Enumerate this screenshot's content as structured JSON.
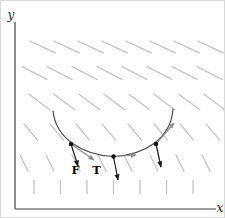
{
  "figure": {
    "background": "#ffffff",
    "labels": {
      "y_axis": "y",
      "x_axis": "x",
      "force": "F",
      "tension": "T"
    },
    "axis": {
      "color": "#3f3f3f",
      "origin": {
        "x": 14,
        "y": 208
      },
      "y_top": 21,
      "x_end": 215
    },
    "field": {
      "color": "#c4c4c4",
      "stroke_width": 1.3,
      "rows": [
        {
          "y": 46,
          "angle": 25,
          "len": 28,
          "x0": 29,
          "spacing": 24,
          "count": 8
        },
        {
          "y": 72,
          "angle": 27,
          "len": 28,
          "x0": 21,
          "spacing": 25,
          "count": 8
        },
        {
          "y": 101,
          "angle": 37,
          "len": 26,
          "x0": 28,
          "spacing": 25,
          "count": 8
        },
        {
          "y": 131,
          "angle": 50,
          "len": 21,
          "x0": 23,
          "spacing": 26,
          "count": 8
        },
        {
          "y": 162,
          "angle": 64,
          "len": 18,
          "x0": 19,
          "spacing": 26,
          "count": 8
        },
        {
          "y": 186,
          "angle": 90,
          "len": 13,
          "x0": 33,
          "spacing": 26.5,
          "count": 7
        }
      ]
    },
    "curve": {
      "color": "#4a4a4a",
      "stroke_width": 1.2,
      "d": "M 52,110 C 55,138 82,154 112.5,155.5 C 143,154 170,138 172,108",
      "dot_color": "#111111",
      "dot_radius": 2.2,
      "points": [
        {
          "x": 70,
          "y": 143
        },
        {
          "x": 112.5,
          "y": 155.5
        },
        {
          "x": 155,
          "y": 143
        }
      ]
    },
    "vectors": {
      "force_color": "#1a1a1a",
      "tension_color": "#8f8f8f",
      "stroke_width": 1.2,
      "arrows": [
        {
          "name": "force-left",
          "kind": "force",
          "x1": 70,
          "y1": 143,
          "x2": 77,
          "y2": 165
        },
        {
          "name": "tension-left",
          "kind": "tension",
          "x1": 70,
          "y1": 143,
          "x2": 93,
          "y2": 159
        },
        {
          "name": "force-bottom",
          "kind": "force",
          "x1": 112.5,
          "y1": 155.5,
          "x2": 117,
          "y2": 179
        },
        {
          "name": "tension-bottom",
          "kind": "tension",
          "x1": 112.5,
          "y1": 155.5,
          "x2": 135,
          "y2": 154
        },
        {
          "name": "force-right",
          "kind": "force",
          "x1": 155,
          "y1": 143,
          "x2": 160,
          "y2": 166
        },
        {
          "name": "tension-right",
          "kind": "tension",
          "x1": 155,
          "y1": 143,
          "x2": 173,
          "y2": 122
        }
      ]
    }
  }
}
